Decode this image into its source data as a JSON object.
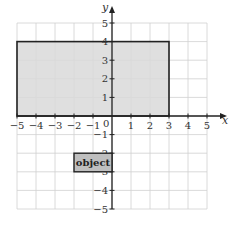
{
  "diagram": {
    "x_axis_label": "x",
    "y_axis_label": "y",
    "x_range": [
      -5,
      5
    ],
    "y_range": [
      -5,
      5
    ],
    "origin_label": "0",
    "x_ticks": [
      "−5",
      "−4",
      "−3",
      "−2",
      "−1",
      "1",
      "2",
      "3",
      "4",
      "5"
    ],
    "y_ticks": [
      "5",
      "4",
      "3",
      "2",
      "1",
      "−1",
      "−2",
      "−3",
      "−4",
      "−5"
    ],
    "large_rectangle": {
      "x1": -5,
      "y1": 0,
      "x2": 3,
      "y2": 4,
      "fill": "#d9d9d9",
      "stroke": "#222222"
    },
    "object_rectangle": {
      "x1": -2,
      "y1": -3,
      "x2": 0,
      "y2": -2,
      "fill": "#bfbfbf",
      "stroke": "#222222",
      "label": "object"
    },
    "colors": {
      "grid": "#d0d0d0",
      "axis": "#222222"
    }
  }
}
